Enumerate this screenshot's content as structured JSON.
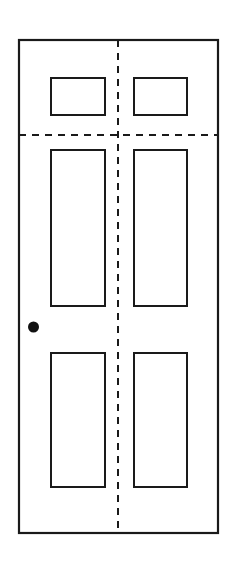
{
  "drawing": {
    "title": "Six-Panel Double Door Elevation",
    "subject": "door",
    "view": "front elevation",
    "style": "line drawing",
    "canvas": {
      "width": 237,
      "height": 569
    },
    "colors": {
      "background": "#ffffff",
      "stroke": "#1a1a1a",
      "panel_fill": "#ffffff",
      "knob_fill": "#111111",
      "dashed_line": "#1a1a1a"
    },
    "stroke_widths": {
      "outer_frame": 2.2,
      "panel": 2.0,
      "dashed": 2.0
    },
    "door_frame": {
      "label": "Door outer frame",
      "x": 19,
      "y": 40,
      "width": 199,
      "height": 493
    },
    "center_divider": {
      "label": "Vertical dashed centerline",
      "orientation": "vertical",
      "x": 118,
      "y_start": 40,
      "y_end": 533,
      "dash": "7 6"
    },
    "rail_divider": {
      "label": "Horizontal dashed rail line",
      "orientation": "horizontal",
      "y": 135,
      "x_start": 19,
      "x_end": 218,
      "dash": "7 6"
    },
    "panels": [
      {
        "name": "panel-top-left",
        "row": "top",
        "side": "left",
        "x": 51,
        "y": 78,
        "width": 54,
        "height": 37
      },
      {
        "name": "panel-top-right",
        "row": "top",
        "side": "right",
        "x": 134,
        "y": 78,
        "width": 53,
        "height": 37
      },
      {
        "name": "panel-middle-left",
        "row": "middle",
        "side": "left",
        "x": 51,
        "y": 150,
        "width": 54,
        "height": 156
      },
      {
        "name": "panel-middle-right",
        "row": "middle",
        "side": "right",
        "x": 134,
        "y": 150,
        "width": 53,
        "height": 156
      },
      {
        "name": "panel-bottom-left",
        "row": "bottom",
        "side": "left",
        "x": 51,
        "y": 353,
        "width": 54,
        "height": 134
      },
      {
        "name": "panel-bottom-right",
        "row": "bottom",
        "side": "right",
        "x": 134,
        "y": 353,
        "width": 53,
        "height": 134
      }
    ],
    "door_knob": {
      "label": "Door knob",
      "shape": "filled circle",
      "cx": 33.5,
      "cy": 327,
      "r": 5.5
    },
    "panel_count": 6,
    "knob_count": 1
  }
}
